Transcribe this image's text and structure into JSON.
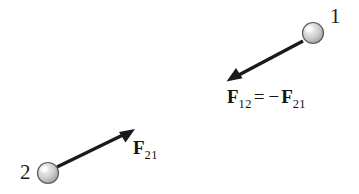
{
  "figure": {
    "background_color": "#ffffff",
    "width": 359,
    "height": 194
  },
  "particles": [
    {
      "id": "1",
      "label": "1",
      "cx": 313,
      "cy": 33,
      "r": 11,
      "fill_light": "#f2f2f2",
      "fill_mid": "#c9c9c9",
      "fill_dark": "#9a9a9a",
      "stroke": "#4a4a4a"
    },
    {
      "id": "2",
      "label": "2",
      "cx": 48,
      "cy": 173,
      "r": 11,
      "fill_light": "#f2f2f2",
      "fill_mid": "#c9c9c9",
      "fill_dark": "#9a9a9a",
      "stroke": "#4a4a4a"
    }
  ],
  "vectors": [
    {
      "name": "force-on-1-by-2",
      "from_x": 303,
      "from_y": 41,
      "to_x": 229,
      "to_y": 80,
      "color": "#1a1a1a",
      "width": 3.4
    },
    {
      "name": "force-on-2-by-1",
      "from_x": 57,
      "from_y": 167,
      "to_x": 133,
      "to_y": 130,
      "color": "#1a1a1a",
      "width": 3.4
    }
  ],
  "labels": {
    "force_12": {
      "symbol": "F",
      "subscript": "12",
      "operator": "=",
      "sign": "−",
      "rhs_symbol": "F",
      "rhs_subscript": "21",
      "full_text": "F12 = −F21"
    },
    "force_21": {
      "symbol": "F",
      "subscript": "21",
      "full_text": "F21"
    }
  }
}
